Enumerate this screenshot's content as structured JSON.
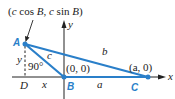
{
  "diagram": {
    "type": "triangle-coordinate-figure",
    "colors": {
      "triangle": "#2a7fc9",
      "axes": "#222222",
      "vertex_labels": "#2a7fc9",
      "text": "#222222"
    },
    "annotation": {
      "text_pre": "(",
      "c1": "c",
      "cos": " cos ",
      "B1": "B",
      "comma": ", ",
      "c2": "c",
      "sin": " sin ",
      "B2": "B",
      "text_post": ")"
    },
    "axes": {
      "x_label": "x",
      "y_label": "y"
    },
    "vertices": {
      "A": {
        "label": "A"
      },
      "B": {
        "label": "B",
        "coords": "(0, 0)"
      },
      "C": {
        "label": "C",
        "coords": "(a, 0)"
      },
      "D": {
        "label": "D"
      }
    },
    "sides": {
      "a": "a",
      "b": "b",
      "c": "c",
      "x": "x",
      "y": "y"
    },
    "right_angle": "90°"
  }
}
